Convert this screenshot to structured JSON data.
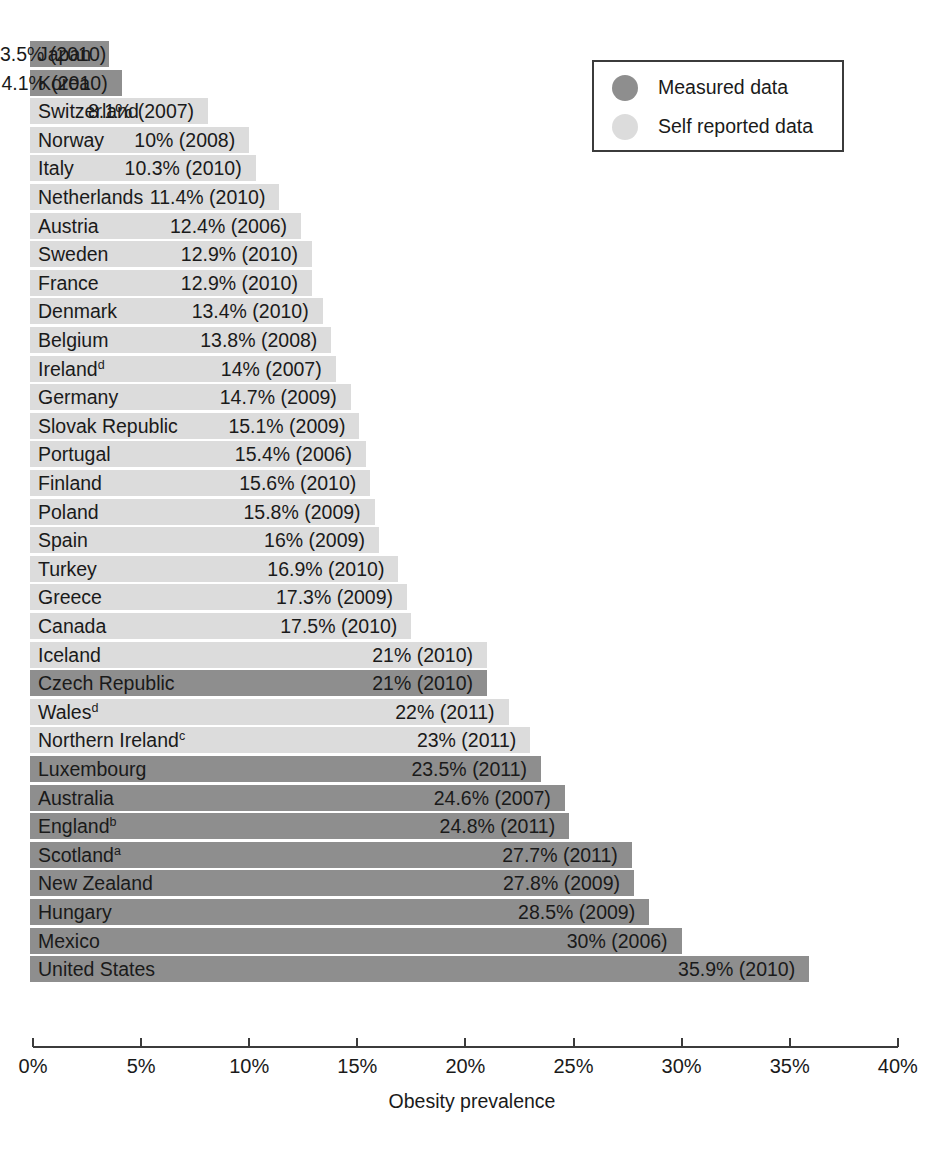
{
  "chart_data": {
    "type": "bar",
    "orientation": "horizontal",
    "title": "",
    "xlabel": "Obesity prevalence",
    "ylabel": "",
    "xlim": [
      0,
      40
    ],
    "xticks": [
      0,
      5,
      10,
      15,
      20,
      25,
      30,
      35,
      40
    ],
    "xtick_labels": [
      "0%",
      "5%",
      "10%",
      "15%",
      "20%",
      "25%",
      "30%",
      "35%",
      "40%"
    ],
    "grid": false,
    "legend_position": "top-right",
    "categories": [
      "Japan",
      "Korea",
      "Switzerland",
      "Norway",
      "Italy",
      "Netherlands",
      "Austria",
      "Sweden",
      "France",
      "Denmark",
      "Belgium",
      "Ireland",
      "Germany",
      "Slovak Republic",
      "Portugal",
      "Finland",
      "Poland",
      "Spain",
      "Turkey",
      "Greece",
      "Canada",
      "Iceland",
      "Czech Republic",
      "Wales",
      "Northern Ireland",
      "Luxembourg",
      "Australia",
      "England",
      "Scotland",
      "New Zealand",
      "Hungary",
      "Mexico",
      "United States"
    ],
    "values": [
      3.5,
      4.1,
      8.1,
      10,
      10.3,
      11.4,
      12.4,
      12.9,
      12.9,
      13.4,
      13.8,
      14,
      14.7,
      15.1,
      15.4,
      15.6,
      15.8,
      16,
      16.9,
      17.3,
      17.5,
      21,
      21,
      22,
      23,
      23.5,
      24.6,
      24.8,
      27.7,
      27.8,
      28.5,
      30,
      35.9
    ],
    "years": [
      2010,
      2010,
      2007,
      2008,
      2010,
      2010,
      2006,
      2010,
      2010,
      2010,
      2008,
      2007,
      2009,
      2009,
      2006,
      2010,
      2009,
      2009,
      2010,
      2009,
      2010,
      2010,
      2010,
      2011,
      2011,
      2011,
      2007,
      2011,
      2011,
      2009,
      2009,
      2006,
      2010
    ],
    "series": [
      {
        "name": "Measured data",
        "color": "#8e8e8e"
      },
      {
        "name": "Self reported data",
        "color": "#dcdcdc"
      }
    ]
  },
  "legend": {
    "items": [
      {
        "label": "Measured data",
        "color": "#8e8e8e"
      },
      {
        "label": "Self reported data",
        "color": "#dcdcdc"
      }
    ]
  },
  "axis": {
    "title": "Obesity prevalence",
    "ticks": [
      "0%",
      "5%",
      "10%",
      "15%",
      "20%",
      "25%",
      "30%",
      "35%",
      "40%"
    ]
  },
  "bars": [
    {
      "name": "Japan",
      "value": 3.5,
      "value_label": "3.5% (2010)",
      "type": "measured",
      "footnote": ""
    },
    {
      "name": "Korea",
      "value": 4.1,
      "value_label": "4.1% (2010)",
      "type": "measured",
      "footnote": ""
    },
    {
      "name": "Switzerland",
      "value": 8.1,
      "value_label": "8.1% (2007)",
      "type": "self_reported",
      "footnote": ""
    },
    {
      "name": "Norway",
      "value": 10,
      "value_label": "10% (2008)",
      "type": "self_reported",
      "footnote": ""
    },
    {
      "name": "Italy",
      "value": 10.3,
      "value_label": "10.3% (2010)",
      "type": "self_reported",
      "footnote": ""
    },
    {
      "name": "Netherlands",
      "value": 11.4,
      "value_label": "11.4% (2010)",
      "type": "self_reported",
      "footnote": ""
    },
    {
      "name": "Austria",
      "value": 12.4,
      "value_label": "12.4% (2006)",
      "type": "self_reported",
      "footnote": ""
    },
    {
      "name": "Sweden",
      "value": 12.9,
      "value_label": "12.9% (2010)",
      "type": "self_reported",
      "footnote": ""
    },
    {
      "name": "France",
      "value": 12.9,
      "value_label": "12.9% (2010)",
      "type": "self_reported",
      "footnote": ""
    },
    {
      "name": "Denmark",
      "value": 13.4,
      "value_label": "13.4% (2010)",
      "type": "self_reported",
      "footnote": ""
    },
    {
      "name": "Belgium",
      "value": 13.8,
      "value_label": "13.8% (2008)",
      "type": "self_reported",
      "footnote": ""
    },
    {
      "name": "Ireland",
      "value": 14,
      "value_label": "14% (2007)",
      "type": "self_reported",
      "footnote": "d"
    },
    {
      "name": "Germany",
      "value": 14.7,
      "value_label": "14.7% (2009)",
      "type": "self_reported",
      "footnote": ""
    },
    {
      "name": "Slovak Republic",
      "value": 15.1,
      "value_label": "15.1% (2009)",
      "type": "self_reported",
      "footnote": ""
    },
    {
      "name": "Portugal",
      "value": 15.4,
      "value_label": "15.4% (2006)",
      "type": "self_reported",
      "footnote": ""
    },
    {
      "name": "Finland",
      "value": 15.6,
      "value_label": "15.6% (2010)",
      "type": "self_reported",
      "footnote": ""
    },
    {
      "name": "Poland",
      "value": 15.8,
      "value_label": "15.8% (2009)",
      "type": "self_reported",
      "footnote": ""
    },
    {
      "name": "Spain",
      "value": 16,
      "value_label": "16% (2009)",
      "type": "self_reported",
      "footnote": ""
    },
    {
      "name": "Turkey",
      "value": 16.9,
      "value_label": "16.9% (2010)",
      "type": "self_reported",
      "footnote": ""
    },
    {
      "name": "Greece",
      "value": 17.3,
      "value_label": "17.3% (2009)",
      "type": "self_reported",
      "footnote": ""
    },
    {
      "name": "Canada",
      "value": 17.5,
      "value_label": "17.5% (2010)",
      "type": "self_reported",
      "footnote": ""
    },
    {
      "name": "Iceland",
      "value": 21,
      "value_label": "21% (2010)",
      "type": "self_reported",
      "footnote": ""
    },
    {
      "name": "Czech Republic",
      "value": 21,
      "value_label": "21% (2010)",
      "type": "measured",
      "footnote": ""
    },
    {
      "name": "Wales",
      "value": 22,
      "value_label": "22% (2011)",
      "type": "self_reported",
      "footnote": "d"
    },
    {
      "name": "Northern Ireland",
      "value": 23,
      "value_label": "23% (2011)",
      "type": "self_reported",
      "footnote": "c"
    },
    {
      "name": "Luxembourg",
      "value": 23.5,
      "value_label": "23.5% (2011)",
      "type": "measured",
      "footnote": ""
    },
    {
      "name": "Australia",
      "value": 24.6,
      "value_label": "24.6% (2007)",
      "type": "measured",
      "footnote": ""
    },
    {
      "name": "England",
      "value": 24.8,
      "value_label": "24.8% (2011)",
      "type": "measured",
      "footnote": "b"
    },
    {
      "name": "Scotland",
      "value": 27.7,
      "value_label": "27.7% (2011)",
      "type": "measured",
      "footnote": "a"
    },
    {
      "name": "New Zealand",
      "value": 27.8,
      "value_label": "27.8% (2009)",
      "type": "measured",
      "footnote": ""
    },
    {
      "name": "Hungary",
      "value": 28.5,
      "value_label": "28.5% (2009)",
      "type": "measured",
      "footnote": ""
    },
    {
      "name": "Mexico",
      "value": 30,
      "value_label": "30% (2006)",
      "type": "measured",
      "footnote": ""
    },
    {
      "name": "United States",
      "value": 35.9,
      "value_label": "35.9% (2010)",
      "type": "measured",
      "footnote": ""
    }
  ],
  "colors": {
    "measured": "#8e8e8e",
    "self_reported": "#dcdcdc",
    "axis": "#3b3b3b",
    "text": "#1a1a1a",
    "background": "#ffffff"
  }
}
